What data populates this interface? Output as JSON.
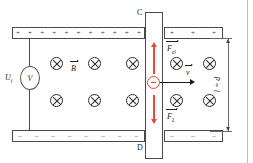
{
  "figure": {
    "colors": {
      "force_arrow": "#e8493f",
      "charge_outline": "#e8493f",
      "conductor_outline": "#4a4a4a",
      "field_symbol": "#2e2e2e",
      "page_rule": "#f0a9a2"
    }
  },
  "plates": {
    "top": {
      "name": "positive-plate",
      "charge_symbol": "+",
      "left_segment_count": 11,
      "right_segment_count": 3
    },
    "bottom": {
      "name": "negative-plate",
      "charge_symbol": "–",
      "left_segment_count": 8,
      "right_segment_count": 3
    }
  },
  "rod": {
    "top_node_label": "C",
    "bottom_node_label": "D"
  },
  "voltmeter": {
    "symbol": "V",
    "label_main": "U",
    "label_sub": "i"
  },
  "field": {
    "label_main": "B",
    "symbol": "⊗",
    "rows": 2,
    "columns_left": 3,
    "columns_right": 2
  },
  "velocity": {
    "label_main": "v"
  },
  "forces": [
    {
      "name": "electric-force",
      "label_main": "F",
      "label_sub": "el",
      "direction": "up"
    },
    {
      "name": "lorentz-force",
      "label_main": "F",
      "label_sub": "L",
      "direction": "down"
    }
  ],
  "charge": {
    "sign": "–",
    "type": "electron"
  },
  "dimension": {
    "text": "l = d"
  }
}
